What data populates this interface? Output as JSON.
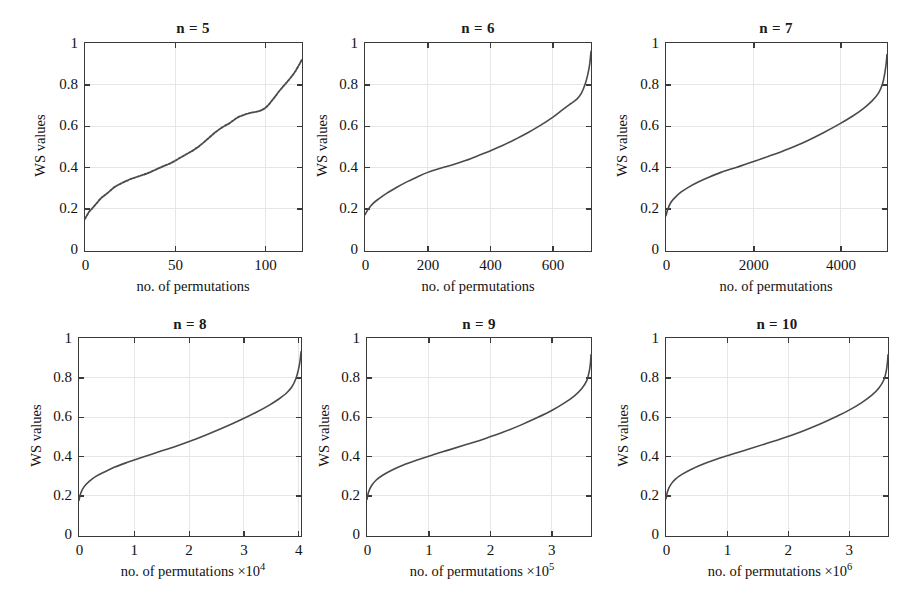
{
  "figure": {
    "panel_count": 6,
    "shared_ylabel": "WS values",
    "shared_xlabel": "no. of permutations",
    "background_color": "#ffffff",
    "curve_color": "#4a4a4a",
    "axis_color": "#3a3a3a",
    "grid_color": "#e6e6e6"
  },
  "chart_data": [
    {
      "type": "line",
      "title": "n = 5",
      "xlabel": "no. of permutations",
      "ylabel": "WS values",
      "xlim": [
        0,
        120
      ],
      "ylim": [
        0,
        1
      ],
      "xticks": [
        0,
        50,
        100
      ],
      "xticklabels": [
        "0",
        "50",
        "100"
      ],
      "yticks": [
        0,
        0.2,
        0.4,
        0.6,
        0.8,
        1
      ],
      "yticklabels": [
        "0",
        "0.2",
        "0.4",
        "0.6",
        "0.8",
        "1"
      ],
      "grid": true,
      "exponent": "",
      "n": 5,
      "total_permutations": 120,
      "line_style": "dotted",
      "series": [
        {
          "name": "sorted WS values",
          "x": [
            0,
            2,
            4,
            6,
            9,
            12,
            16,
            20,
            25,
            30,
            35,
            40,
            44,
            48,
            52,
            56,
            60,
            64,
            68,
            72,
            76,
            80,
            84,
            88,
            92,
            96,
            100,
            104,
            108,
            112,
            116,
            120
          ],
          "y": [
            0.155,
            0.185,
            0.205,
            0.225,
            0.255,
            0.275,
            0.305,
            0.325,
            0.345,
            0.36,
            0.375,
            0.395,
            0.41,
            0.425,
            0.445,
            0.465,
            0.485,
            0.51,
            0.54,
            0.57,
            0.595,
            0.615,
            0.64,
            0.655,
            0.665,
            0.672,
            0.69,
            0.73,
            0.775,
            0.815,
            0.86,
            0.92
          ]
        }
      ]
    },
    {
      "type": "line",
      "title": "n = 6",
      "xlabel": "no. of permutations",
      "ylabel": "WS values",
      "xlim": [
        0,
        720
      ],
      "ylim": [
        0,
        1
      ],
      "xticks": [
        0,
        200,
        400,
        600
      ],
      "xticklabels": [
        "0",
        "200",
        "400",
        "600"
      ],
      "yticks": [
        0,
        0.2,
        0.4,
        0.6,
        0.8,
        1
      ],
      "yticklabels": [
        "0",
        "0.2",
        "0.4",
        "0.6",
        "0.8",
        "1"
      ],
      "grid": true,
      "exponent": "",
      "n": 6,
      "total_permutations": 720,
      "line_style": "solid",
      "series": [
        {
          "name": "sorted WS values",
          "x": [
            0,
            10,
            25,
            45,
            70,
            100,
            130,
            165,
            200,
            240,
            280,
            320,
            360,
            400,
            440,
            480,
            520,
            560,
            600,
            630,
            655,
            675,
            690,
            702,
            710,
            716,
            720
          ],
          "y": [
            0.175,
            0.2,
            0.228,
            0.252,
            0.278,
            0.305,
            0.33,
            0.355,
            0.378,
            0.398,
            0.415,
            0.435,
            0.458,
            0.482,
            0.508,
            0.538,
            0.57,
            0.605,
            0.645,
            0.68,
            0.708,
            0.73,
            0.76,
            0.805,
            0.85,
            0.9,
            0.96
          ]
        }
      ]
    },
    {
      "type": "line",
      "title": "n = 7",
      "xlabel": "no. of permutations",
      "ylabel": "WS values",
      "xlim": [
        0,
        5040
      ],
      "ylim": [
        0,
        1
      ],
      "xticks": [
        0,
        2000,
        4000
      ],
      "xticklabels": [
        "0",
        "2000",
        "4000"
      ],
      "yticks": [
        0,
        0.2,
        0.4,
        0.6,
        0.8,
        1
      ],
      "yticklabels": [
        "0",
        "0.2",
        "0.4",
        "0.6",
        "0.8",
        "1"
      ],
      "grid": true,
      "exponent": "",
      "n": 7,
      "total_permutations": 5040,
      "line_style": "solid",
      "series": [
        {
          "name": "sorted WS values",
          "x": [
            0,
            40,
            110,
            210,
            340,
            500,
            700,
            950,
            1250,
            1600,
            2000,
            2400,
            2800,
            3200,
            3600,
            3950,
            4250,
            4500,
            4700,
            4850,
            4940,
            4990,
            5020,
            5040
          ],
          "y": [
            0.17,
            0.2,
            0.233,
            0.258,
            0.283,
            0.305,
            0.328,
            0.352,
            0.378,
            0.402,
            0.43,
            0.46,
            0.492,
            0.528,
            0.57,
            0.61,
            0.648,
            0.685,
            0.722,
            0.76,
            0.805,
            0.855,
            0.9,
            0.945
          ]
        }
      ]
    },
    {
      "type": "line",
      "title": "n = 8",
      "xlabel": "no. of permutations",
      "ylabel": "WS values",
      "xlim": [
        0,
        40320
      ],
      "ylim": [
        0,
        1
      ],
      "xticks": [
        0,
        10000,
        20000,
        30000,
        40000
      ],
      "xticklabels": [
        "0",
        "1",
        "2",
        "3",
        "4"
      ],
      "yticks": [
        0,
        0.2,
        0.4,
        0.6,
        0.8,
        1
      ],
      "yticklabels": [
        "0",
        "0.2",
        "0.4",
        "0.6",
        "0.8",
        "1"
      ],
      "grid": true,
      "exponent": "×10",
      "exponent_power": "4",
      "n": 8,
      "total_permutations": 40320,
      "line_style": "solid",
      "series": [
        {
          "name": "sorted WS values",
          "x": [
            0,
            300,
            900,
            1800,
            3000,
            4600,
            6500,
            8800,
            11500,
            14500,
            17500,
            20500,
            23500,
            26500,
            29500,
            32200,
            34500,
            36300,
            37700,
            38700,
            39400,
            39850,
            40150,
            40320
          ],
          "y": [
            0.18,
            0.215,
            0.248,
            0.275,
            0.3,
            0.323,
            0.348,
            0.372,
            0.398,
            0.425,
            0.452,
            0.482,
            0.515,
            0.55,
            0.588,
            0.625,
            0.66,
            0.692,
            0.722,
            0.755,
            0.795,
            0.84,
            0.885,
            0.93
          ]
        }
      ]
    },
    {
      "type": "line",
      "title": "n = 9",
      "xlabel": "no. of permutations",
      "ylabel": "WS values",
      "xlim": [
        0,
        362880
      ],
      "ylim": [
        0,
        1
      ],
      "xticks": [
        0,
        100000,
        200000,
        300000
      ],
      "xticklabels": [
        "0",
        "1",
        "2",
        "3"
      ],
      "yticks": [
        0,
        0.2,
        0.4,
        0.6,
        0.8,
        1
      ],
      "yticklabels": [
        "0",
        "0.2",
        "0.4",
        "0.6",
        "0.8",
        "1"
      ],
      "grid": true,
      "exponent": "×10",
      "exponent_power": "5",
      "n": 9,
      "total_permutations": 362880,
      "line_style": "solid",
      "series": [
        {
          "name": "sorted WS values",
          "x": [
            0,
            2500,
            7500,
            15000,
            26000,
            40000,
            58000,
            80000,
            105000,
            133000,
            162000,
            192000,
            221000,
            249000,
            276000,
            300000,
            320000,
            336000,
            348000,
            356000,
            360000,
            362000,
            362880
          ],
          "y": [
            0.185,
            0.222,
            0.255,
            0.283,
            0.308,
            0.332,
            0.357,
            0.382,
            0.408,
            0.435,
            0.463,
            0.493,
            0.525,
            0.56,
            0.598,
            0.635,
            0.672,
            0.708,
            0.745,
            0.785,
            0.83,
            0.875,
            0.915
          ]
        }
      ]
    },
    {
      "type": "line",
      "title": "n = 10",
      "xlabel": "no. of permutations",
      "ylabel": "WS values",
      "xlim": [
        0,
        3628800
      ],
      "ylim": [
        0,
        1
      ],
      "xticks": [
        0,
        1000000,
        2000000,
        3000000
      ],
      "xticklabels": [
        "0",
        "1",
        "2",
        "3"
      ],
      "yticks": [
        0,
        0.2,
        0.4,
        0.6,
        0.8,
        1
      ],
      "yticklabels": [
        "0",
        "0.2",
        "0.4",
        "0.6",
        "0.8",
        "1"
      ],
      "grid": true,
      "exponent": "×10",
      "exponent_power": "6",
      "n": 10,
      "total_permutations": 3628800,
      "line_style": "solid",
      "series": [
        {
          "name": "sorted WS values",
          "x": [
            0,
            25000,
            75000,
            150000,
            260000,
            400000,
            580000,
            800000,
            1050000,
            1330000,
            1620000,
            1920000,
            2210000,
            2490000,
            2760000,
            3000000,
            3200000,
            3360000,
            3480000,
            3560000,
            3600000,
            3620000,
            3628800
          ],
          "y": [
            0.188,
            0.225,
            0.258,
            0.286,
            0.311,
            0.335,
            0.36,
            0.385,
            0.41,
            0.437,
            0.465,
            0.495,
            0.527,
            0.562,
            0.6,
            0.637,
            0.674,
            0.71,
            0.748,
            0.788,
            0.832,
            0.878,
            0.915
          ]
        }
      ]
    }
  ]
}
